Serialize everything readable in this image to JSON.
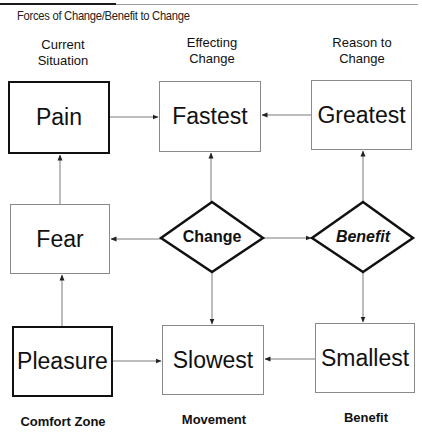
{
  "header": {
    "title": "Forces of Change/Benefit to Change"
  },
  "columns": [
    {
      "heading_line1": "Current",
      "heading_line2": "Situation",
      "footer": "Comfort Zone"
    },
    {
      "heading_line1": "Effecting",
      "heading_line2": "Change",
      "footer": "Movement"
    },
    {
      "heading_line1": "Reason to",
      "heading_line2": "Change",
      "footer": "Benefit"
    }
  ],
  "nodes": {
    "pain": "Pain",
    "fastest": "Fastest",
    "greatest": "Greatest",
    "fear": "Fear",
    "change": "Change",
    "benefit": "Benefit",
    "pleasure": "Pleasure",
    "slowest": "Slowest",
    "smallest": "Smallest"
  },
  "edges": [
    {
      "from": "Pain",
      "to": "Fastest"
    },
    {
      "from": "Greatest",
      "to": "Fastest"
    },
    {
      "from": "Fear",
      "to": "Pain"
    },
    {
      "from": "Change",
      "to": "Fastest"
    },
    {
      "from": "Benefit",
      "to": "Greatest"
    },
    {
      "from": "Change",
      "to": "Fear"
    },
    {
      "from": "Change",
      "to": "Benefit"
    },
    {
      "from": "Change",
      "to": "Slowest"
    },
    {
      "from": "Benefit",
      "to": "Smallest"
    },
    {
      "from": "Pleasure",
      "to": "Fear"
    },
    {
      "from": "Pleasure",
      "to": "Slowest"
    },
    {
      "from": "Smallest",
      "to": "Slowest"
    }
  ],
  "colors": {
    "thick_border": "#111111",
    "thin_border": "#8a8a8a",
    "connector": "#7a7a7a"
  }
}
